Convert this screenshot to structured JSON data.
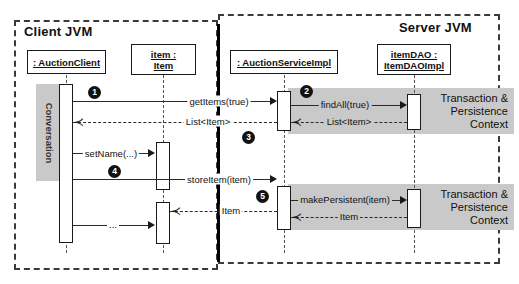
{
  "diagram": {
    "regions": [
      {
        "name": "client-jvm",
        "label": "Client JVM"
      },
      {
        "name": "server-jvm",
        "label": "Server JVM"
      }
    ],
    "lifelines": [
      {
        "name": "auction-client",
        "label": ": AuctionClient",
        "lines": [
          ": AuctionClient"
        ]
      },
      {
        "name": "item",
        "label": "item : Item",
        "lines": [
          "item :",
          "Item"
        ]
      },
      {
        "name": "auction-service-impl",
        "label": ": AuctionServiceImpl",
        "lines": [
          ": AuctionServiceImpl"
        ]
      },
      {
        "name": "item-dao",
        "label": "itemDAO : ItemDAOImpl",
        "lines": [
          "itemDAO :",
          "ItemDAOImpl"
        ]
      }
    ],
    "conversation_bar": {
      "label": "Conversation"
    },
    "transaction_bands": [
      {
        "name": "tx-band-1",
        "lines": [
          "Transaction &",
          "Persistence",
          "Context"
        ]
      },
      {
        "name": "tx-band-2",
        "lines": [
          "Transaction &",
          "Persistence",
          "Context"
        ]
      }
    ],
    "messages": [
      {
        "name": "get-items",
        "label": "getItems(true)",
        "kind": "call"
      },
      {
        "name": "find-all",
        "label": "findAll(true)",
        "kind": "call"
      },
      {
        "name": "list-item-return-dao",
        "label": "List<Item>",
        "kind": "return"
      },
      {
        "name": "list-item-return-client",
        "label": "List<Item>",
        "kind": "return"
      },
      {
        "name": "set-name",
        "label": "setName(...)",
        "kind": "call"
      },
      {
        "name": "store-item",
        "label": "storeItem(item)",
        "kind": "call"
      },
      {
        "name": "make-persistent",
        "label": "makePersistent(item)",
        "kind": "call"
      },
      {
        "name": "item-return-dao",
        "label": "Item",
        "kind": "return"
      },
      {
        "name": "item-return-client",
        "label": "Item",
        "kind": "return"
      },
      {
        "name": "ellipsis-call",
        "label": "...",
        "kind": "call"
      }
    ],
    "step_markers": [
      {
        "name": "step-1",
        "label": "1"
      },
      {
        "name": "step-2",
        "label": "2"
      },
      {
        "name": "step-3",
        "label": "3"
      },
      {
        "name": "step-4",
        "label": "4"
      },
      {
        "name": "step-5",
        "label": "5"
      }
    ],
    "colors": {
      "gray_band": "#c9c9c9",
      "line": "#2a2a2a",
      "marker": "#111111",
      "background": "#ffffff"
    }
  }
}
